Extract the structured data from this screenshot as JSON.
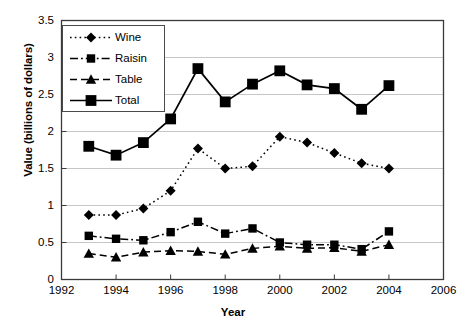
{
  "chart_data": {
    "type": "line",
    "title": "",
    "xlabel": "Year",
    "ylabel": "Value (billions of dollars)",
    "xlim": [
      1992,
      2006
    ],
    "ylim": [
      0,
      3.5
    ],
    "xticks": [
      "1992",
      "1994",
      "1996",
      "1998",
      "2000",
      "2002",
      "2004",
      "2006"
    ],
    "yticks": [
      "0",
      "0.5",
      "1",
      "1.5",
      "2",
      "2.5",
      "3",
      "3.5"
    ],
    "grid": true,
    "legend_position": "upper-left-inside",
    "x": [
      1993,
      1994,
      1995,
      1996,
      1997,
      1998,
      1999,
      2000,
      2001,
      2002,
      2003,
      2004
    ],
    "series": [
      {
        "name": "Wine",
        "marker": "diamond",
        "linestyle": "dotted",
        "color": "#000000",
        "values": [
          0.87,
          0.87,
          0.96,
          1.2,
          1.77,
          1.5,
          1.53,
          1.93,
          1.85,
          1.71,
          1.57,
          1.5
        ]
      },
      {
        "name": "Raisin",
        "marker": "square",
        "linestyle": "dash-dot",
        "color": "#000000",
        "values": [
          0.59,
          0.55,
          0.53,
          0.64,
          0.78,
          0.62,
          0.69,
          0.5,
          0.47,
          0.47,
          0.41,
          0.65
        ]
      },
      {
        "name": "Table",
        "marker": "triangle",
        "linestyle": "dashed",
        "color": "#000000",
        "values": [
          0.35,
          0.3,
          0.37,
          0.39,
          0.38,
          0.34,
          0.42,
          0.45,
          0.42,
          0.43,
          0.38,
          0.47
        ]
      },
      {
        "name": "Total",
        "marker": "square-large",
        "linestyle": "solid",
        "color": "#000000",
        "values": [
          1.8,
          1.68,
          1.85,
          2.17,
          2.85,
          2.4,
          2.64,
          2.82,
          2.63,
          2.58,
          2.3,
          2.62
        ]
      }
    ]
  }
}
